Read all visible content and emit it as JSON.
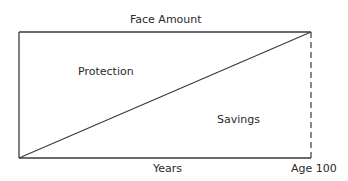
{
  "diagram": {
    "labels": {
      "top": "Face Amount",
      "upper_region": "Protection",
      "lower_region": "Savings",
      "x_axis": "Years",
      "x_axis_end": "Age 100"
    },
    "colors": {
      "line": "#3a3a3a",
      "text": "#2a2a2a"
    }
  }
}
